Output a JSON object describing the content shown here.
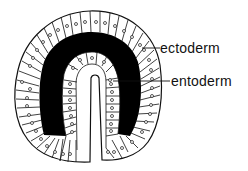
{
  "figure": {
    "labels": [
      {
        "id": "ectoderm",
        "text": "ectoderm"
      },
      {
        "id": "entoderm",
        "text": "entoderm"
      }
    ],
    "colors": {
      "line": "#111111",
      "fill": "#ffffff",
      "blastocoel": "#000000"
    }
  }
}
